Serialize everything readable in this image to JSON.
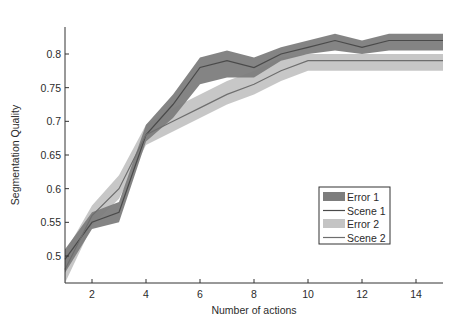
{
  "chart_data": {
    "type": "line",
    "title": "",
    "xlabel": "Number of actions",
    "ylabel": "Segmentation Quality",
    "xlim": [
      1,
      15
    ],
    "ylim": [
      0.46,
      0.84
    ],
    "xticks": [
      2,
      4,
      6,
      8,
      10,
      12,
      14
    ],
    "yticks": [
      0.5,
      0.55,
      0.6,
      0.65,
      0.7,
      0.75,
      0.8
    ],
    "ytick_labels": [
      "0.5",
      "0.55",
      "0.6",
      "0.65",
      "0.7",
      "0.75",
      "0.8"
    ],
    "xtick_labels": [
      "2",
      "4",
      "6",
      "8",
      "10",
      "12",
      "14"
    ],
    "grid": false,
    "legend_position": "lower right (inside)",
    "x": [
      1,
      2,
      3,
      4,
      5,
      6,
      7,
      8,
      9,
      10,
      11,
      12,
      13,
      14,
      15
    ],
    "series": [
      {
        "name": "Scene 1",
        "error_name": "Error 1",
        "line_color": "#4a4a4a",
        "band_color": "#7d7d7d",
        "values": [
          0.495,
          0.55,
          0.565,
          0.68,
          0.725,
          0.78,
          0.79,
          0.78,
          0.8,
          0.81,
          0.82,
          0.81,
          0.82,
          0.82,
          0.82
        ],
        "lower": [
          0.475,
          0.54,
          0.55,
          0.67,
          0.705,
          0.755,
          0.765,
          0.765,
          0.79,
          0.8,
          0.805,
          0.8,
          0.805,
          0.805,
          0.805
        ],
        "upper": [
          0.51,
          0.565,
          0.58,
          0.695,
          0.74,
          0.795,
          0.805,
          0.795,
          0.81,
          0.82,
          0.83,
          0.82,
          0.83,
          0.83,
          0.83
        ]
      },
      {
        "name": "Scene 2",
        "error_name": "Error 2",
        "line_color": "#6e6e6e",
        "band_color": "#c4c4c4",
        "values": [
          0.48,
          0.56,
          0.6,
          0.68,
          0.7,
          0.72,
          0.74,
          0.755,
          0.775,
          0.79,
          0.79,
          0.79,
          0.79,
          0.79,
          0.79
        ],
        "lower": [
          0.46,
          0.545,
          0.585,
          0.665,
          0.685,
          0.705,
          0.725,
          0.74,
          0.76,
          0.775,
          0.775,
          0.775,
          0.775,
          0.775,
          0.775
        ],
        "upper": [
          0.505,
          0.575,
          0.62,
          0.695,
          0.72,
          0.74,
          0.76,
          0.775,
          0.795,
          0.8,
          0.8,
          0.8,
          0.8,
          0.8,
          0.8
        ]
      }
    ],
    "legend": [
      {
        "label": "Error 1",
        "kind": "patch",
        "color": "#7d7d7d"
      },
      {
        "label": "Scene 1",
        "kind": "line",
        "color": "#4a4a4a"
      },
      {
        "label": "Error 2",
        "kind": "patch",
        "color": "#c4c4c4"
      },
      {
        "label": "Scene 2",
        "kind": "line",
        "color": "#6e6e6e"
      }
    ]
  }
}
